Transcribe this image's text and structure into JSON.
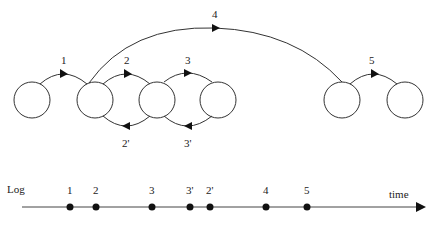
{
  "diagram": {
    "nodes": [
      {
        "id": "n1",
        "cx": 32
      },
      {
        "id": "n2",
        "cx": 95
      },
      {
        "id": "n3",
        "cx": 157
      },
      {
        "id": "n4",
        "cx": 218
      },
      {
        "id": "n5",
        "cx": 342
      },
      {
        "id": "n6",
        "cx": 405
      }
    ],
    "forward_arcs": [
      {
        "label": "1",
        "from": "n1",
        "to": "n2"
      },
      {
        "label": "2",
        "from": "n2",
        "to": "n3"
      },
      {
        "label": "3",
        "from": "n3",
        "to": "n4"
      },
      {
        "label": "4",
        "from": "n2",
        "to": "n5"
      },
      {
        "label": "5",
        "from": "n5",
        "to": "n6"
      }
    ],
    "backward_arcs": [
      {
        "label": "2'",
        "from": "n3",
        "to": "n2"
      },
      {
        "label": "3'",
        "from": "n4",
        "to": "n3"
      }
    ]
  },
  "timeline": {
    "start_label": "Log",
    "end_label": "time",
    "events": [
      {
        "label": "1",
        "x": 70
      },
      {
        "label": "2",
        "x": 96
      },
      {
        "label": "3",
        "x": 152
      },
      {
        "label": "3'",
        "x": 190
      },
      {
        "label": "2'",
        "x": 210
      },
      {
        "label": "4",
        "x": 266
      },
      {
        "label": "5",
        "x": 307
      }
    ]
  }
}
